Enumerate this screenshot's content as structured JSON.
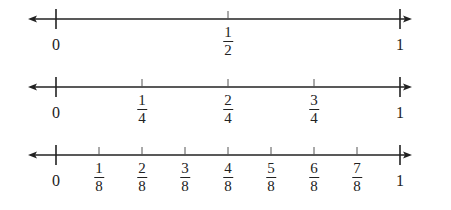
{
  "diagram": {
    "title": "",
    "number_lines": [
      {
        "name": "halves",
        "denominator": 2,
        "y": 19,
        "ticks": [
          {
            "value": 0,
            "label": "0",
            "fraction": false
          },
          {
            "value": 0.5,
            "numerator": "1",
            "denominator": "2",
            "fraction": true
          },
          {
            "value": 1,
            "label": "1",
            "fraction": false
          }
        ]
      },
      {
        "name": "fourths",
        "denominator": 4,
        "y": 87,
        "ticks": [
          {
            "value": 0,
            "label": "0",
            "fraction": false
          },
          {
            "value": 0.25,
            "numerator": "1",
            "denominator": "4",
            "fraction": true
          },
          {
            "value": 0.5,
            "numerator": "2",
            "denominator": "4",
            "fraction": true
          },
          {
            "value": 0.75,
            "numerator": "3",
            "denominator": "4",
            "fraction": true
          },
          {
            "value": 1,
            "label": "1",
            "fraction": false
          }
        ]
      },
      {
        "name": "eighths",
        "denominator": 8,
        "y": 155,
        "ticks": [
          {
            "value": 0,
            "label": "0",
            "fraction": false
          },
          {
            "value": 0.125,
            "numerator": "1",
            "denominator": "8",
            "fraction": true
          },
          {
            "value": 0.25,
            "numerator": "2",
            "denominator": "8",
            "fraction": true
          },
          {
            "value": 0.375,
            "numerator": "3",
            "denominator": "8",
            "fraction": true
          },
          {
            "value": 0.5,
            "numerator": "4",
            "denominator": "8",
            "fraction": true
          },
          {
            "value": 0.625,
            "numerator": "5",
            "denominator": "8",
            "fraction": true
          },
          {
            "value": 0.75,
            "numerator": "6",
            "denominator": "8",
            "fraction": true
          },
          {
            "value": 0.875,
            "numerator": "7",
            "denominator": "8",
            "fraction": true
          },
          {
            "value": 1,
            "label": "1",
            "fraction": false
          }
        ]
      }
    ],
    "colors": {
      "line": "#222222",
      "minor_tick": "#555555"
    }
  }
}
